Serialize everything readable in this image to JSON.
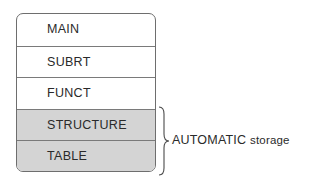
{
  "diagram": {
    "segments": [
      {
        "label": "MAIN",
        "shaded": false
      },
      {
        "label": "SUBRT",
        "shaded": false
      },
      {
        "label": "FUNCT",
        "shaded": false
      },
      {
        "label": "STRUCTURE",
        "shaded": true
      },
      {
        "label": "TABLE",
        "shaded": true
      }
    ],
    "brace_annotation": {
      "main": "AUTOMATIC",
      "suffix": "storage"
    },
    "colors": {
      "shaded_fill": "#d4d4d4",
      "border": "#6e6e6e"
    }
  }
}
